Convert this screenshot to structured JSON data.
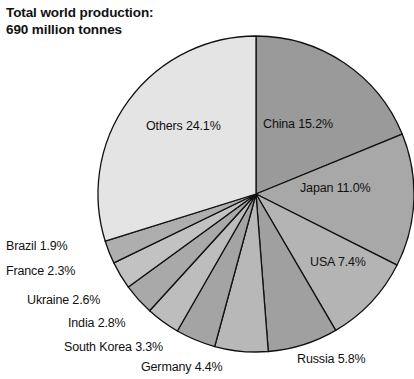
{
  "title": {
    "line1": "Total world production:",
    "line2": "690 million tonnes"
  },
  "chart_data": {
    "type": "pie",
    "title": "Total world production: 690 million tonnes",
    "unit": "%",
    "total_label": "690 million tonnes",
    "total_value": 690,
    "total_unit": "million tonnes",
    "start_angle_deg": 0,
    "direction": "clockwise",
    "legend": "none",
    "grid": false,
    "labels": [
      "China 15.2%",
      "Japan 11.0%",
      "USA 7.4%",
      "Russia 5.8%",
      "Germany 4.4%",
      "South Korea 3.3%",
      "India 2.8%",
      "Ukraine 2.6%",
      "France 2.3%",
      "Brazil 1.9%",
      "Others 24.1%"
    ],
    "categories": [
      "China",
      "Japan",
      "USA",
      "Russia",
      "Germany",
      "South Korea",
      "India",
      "Ukraine",
      "France",
      "Brazil",
      "Others"
    ],
    "values": [
      15.2,
      11.0,
      7.4,
      5.8,
      4.4,
      3.3,
      2.8,
      2.6,
      2.3,
      1.9,
      24.1
    ],
    "value_texts": [
      "15.2%",
      "11.0%",
      "7.4%",
      "5.8%",
      "4.4%",
      "3.3%",
      "2.8%",
      "2.6%",
      "2.3%",
      "1.9%",
      "24.1%"
    ],
    "colors": [
      "#9a9a9a",
      "#a8a8a8",
      "#b4b4b4",
      "#a0a0a0",
      "#b8b8b8",
      "#a4a4a4",
      "#bdbdbd",
      "#a9a9a9",
      "#c2c2c2",
      "#aeaeae",
      "#e4e4e4"
    ],
    "slices": [
      {
        "name": "China",
        "value": 15.2,
        "label": "China 15.2%",
        "color": "#9a9a9a",
        "label_x": 263,
        "label_y": 117,
        "inside": true
      },
      {
        "name": "Japan",
        "value": 11.0,
        "label": "Japan 11.0%",
        "color": "#a8a8a8",
        "label_x": 300,
        "label_y": 181,
        "inside": true
      },
      {
        "name": "USA",
        "value": 7.4,
        "label": "USA 7.4%",
        "color": "#b4b4b4",
        "label_x": 310,
        "label_y": 255,
        "inside": true
      },
      {
        "name": "Russia",
        "value": 5.8,
        "label": "Russia 5.8%",
        "color": "#a0a0a0",
        "label_x": 297,
        "label_y": 352,
        "inside": false
      },
      {
        "name": "Germany",
        "value": 4.4,
        "label": "Germany 4.4%",
        "color": "#b8b8b8",
        "label_x": 141,
        "label_y": 360,
        "inside": false
      },
      {
        "name": "South Korea",
        "value": 3.3,
        "label": "South Korea 3.3%",
        "color": "#a4a4a4",
        "label_x": 64,
        "label_y": 340,
        "inside": false
      },
      {
        "name": "India",
        "value": 2.8,
        "label": "India 2.8%",
        "color": "#bdbdbd",
        "label_x": 68,
        "label_y": 316,
        "inside": false
      },
      {
        "name": "Ukraine",
        "value": 2.6,
        "label": "Ukraine 2.6%",
        "color": "#a9a9a9",
        "label_x": 27,
        "label_y": 293,
        "inside": false
      },
      {
        "name": "France",
        "value": 2.3,
        "label": "France 2.3%",
        "color": "#c2c2c2",
        "label_x": 6,
        "label_y": 264,
        "inside": false
      },
      {
        "name": "Brazil",
        "value": 1.9,
        "label": "Brazil 1.9%",
        "color": "#aeaeae",
        "label_x": 6,
        "label_y": 239,
        "inside": false
      },
      {
        "name": "Others",
        "value": 24.1,
        "label": "Others 24.1%",
        "color": "#e4e4e4",
        "label_x": 146,
        "label_y": 119,
        "inside": true
      }
    ],
    "geometry": {
      "center_x": 256,
      "center_y": 194,
      "radius": 158,
      "stroke": "#111111",
      "stroke_width": 1.3,
      "background": "#ffffff"
    }
  }
}
